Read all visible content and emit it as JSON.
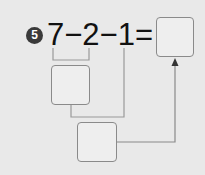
{
  "problem": {
    "number": "5",
    "expression": "7−2−1=",
    "terms": [
      "7",
      "2",
      "1"
    ],
    "operators": [
      "−",
      "−",
      "="
    ]
  },
  "boxes": {
    "first_step": "",
    "second_step": "",
    "answer": ""
  },
  "colors": {
    "background": "#e9e9e9",
    "line": "#8a8a8a",
    "text": "#111111",
    "badge": "#3a3a3a"
  }
}
